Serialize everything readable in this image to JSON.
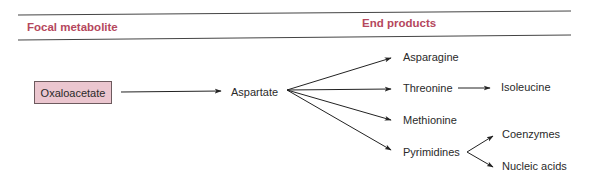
{
  "header": {
    "focal_label": "Focal metabolite",
    "end_label": "End products"
  },
  "colors": {
    "header_text": "#b5475d",
    "box_fill": "#ebc6cf",
    "line": "#333333"
  },
  "nodes": {
    "focal": "Oxaloacetate",
    "intermediate": "Aspartate",
    "products": [
      "Asparagine",
      "Threonine",
      "Methionine",
      "Pyrimidines"
    ],
    "threonine_product": "Isoleucine",
    "pyrimidine_products": [
      "Coenzymes",
      "Nucleic acids"
    ]
  },
  "edges": [
    [
      "Oxaloacetate",
      "Aspartate"
    ],
    [
      "Aspartate",
      "Asparagine"
    ],
    [
      "Aspartate",
      "Threonine"
    ],
    [
      "Aspartate",
      "Methionine"
    ],
    [
      "Aspartate",
      "Pyrimidines"
    ],
    [
      "Threonine",
      "Isoleucine"
    ],
    [
      "Pyrimidines",
      "Coenzymes"
    ],
    [
      "Pyrimidines",
      "Nucleic acids"
    ]
  ]
}
